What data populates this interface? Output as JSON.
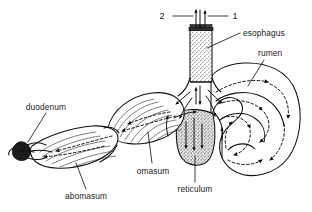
{
  "figure": {
    "background_color": "#ffffff",
    "line_color": "#111111",
    "text_color": "#1a1a1a"
  },
  "labels": {
    "esophagus": "esophagus",
    "rumen": "rumen",
    "reticulum": "reticulum",
    "omasum": "omasum",
    "abomasum": "abomasum",
    "duodenum": "duodenum"
  },
  "callout_numbers": {
    "left": "2",
    "right": "1"
  },
  "icons": {
    "esophagus_up_arrow": "arrow-up-icon",
    "esophagus_down_arrow": "arrow-down-icon",
    "flow_arrow": "flow-arrow-icon"
  },
  "structures": [
    {
      "name": "esophagus",
      "style": "stippled-cylinder",
      "label": "esophagus"
    },
    {
      "name": "rumen",
      "style": "large-sac-dashed-flow",
      "label": "rumen"
    },
    {
      "name": "reticulum",
      "style": "stippled-pouch",
      "label": "reticulum"
    },
    {
      "name": "omasum",
      "style": "laminated-ovoid",
      "label": "omasum"
    },
    {
      "name": "abomasum",
      "style": "striated-sac",
      "label": "abomasum"
    },
    {
      "name": "duodenum",
      "style": "dark-narrow-tip",
      "label": "duodenum"
    }
  ]
}
